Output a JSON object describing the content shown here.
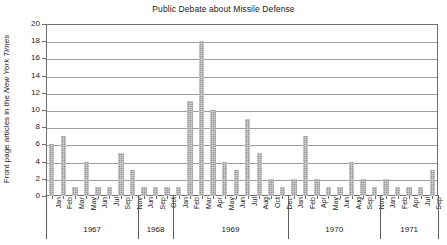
{
  "chart_data": {
    "type": "bar",
    "title": "Public Debate about Missile Defense",
    "xlabel": "",
    "ylabel": "Front page articles in the New York Times",
    "ylabel_plain": "Front page articles in the ",
    "ylabel_italic": "New York Times",
    "ylim": [
      0,
      20
    ],
    "ytick_step": 2,
    "yticks": [
      "20",
      "18",
      "16",
      "14",
      "12",
      "10",
      "8",
      "6",
      "4",
      "2",
      "0"
    ],
    "grid": true,
    "legend": "none",
    "bar_color": "#9a9a9a",
    "axis_color": "#6f6f6f",
    "grid_color": "#9d9d9d",
    "categories": [
      "Jan",
      "Feb",
      "Mar",
      "May",
      "Jun",
      "Jul",
      "Sep",
      "Nov",
      "Jun",
      "Sep",
      "Oct",
      "Jan",
      "Feb",
      "Mar",
      "Apr",
      "May",
      "Jun",
      "Jul",
      "Aug",
      "Oct",
      "Dec",
      "Jan",
      "Feb",
      "Apr",
      "May",
      "Jun",
      "Aug",
      "Sep",
      "Nov",
      "Jan",
      "Feb",
      "Apr",
      "Jul",
      "Sep"
    ],
    "values": [
      6,
      7,
      1,
      4,
      1,
      1,
      5,
      3,
      1,
      1,
      1,
      1,
      11,
      18,
      10,
      4,
      3,
      9,
      5,
      2,
      1,
      2,
      7,
      2,
      1,
      1,
      4,
      2,
      1,
      2,
      1,
      1,
      1,
      3
    ],
    "groups": [
      {
        "year": "1967",
        "count": 8
      },
      {
        "year": "1968",
        "count": 3
      },
      {
        "year": "1969",
        "count": 10
      },
      {
        "year": "1970",
        "count": 8
      },
      {
        "year": "1971",
        "count": 5
      }
    ]
  }
}
